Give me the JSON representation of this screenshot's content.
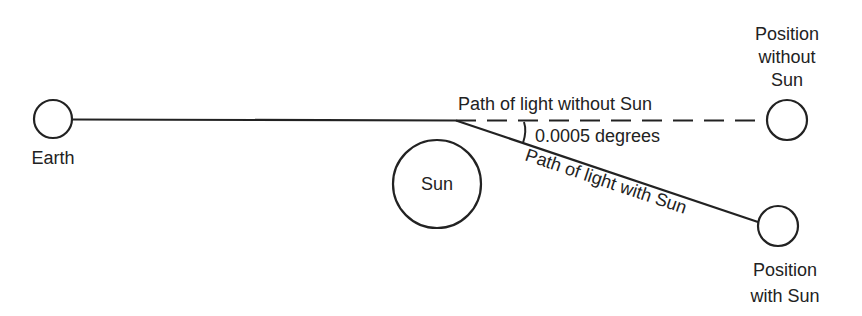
{
  "diagram": {
    "type": "gravitational-light-deflection",
    "colors": {
      "ink": "#222222",
      "background": "#ffffff"
    },
    "bodies": {
      "earth": {
        "label": "Earth"
      },
      "sun": {
        "label": "Sun"
      },
      "star_without_sun": {
        "label_lines": [
          "Position",
          "without",
          "Sun"
        ]
      },
      "star_with_sun": {
        "label_lines": [
          "Position",
          "with Sun"
        ]
      }
    },
    "paths": {
      "without_sun": {
        "label": "Path of light without Sun",
        "style": "dashed"
      },
      "with_sun": {
        "label": "Path of light with Sun",
        "style": "solid"
      }
    },
    "angle": {
      "label": "0.0005 degrees"
    }
  }
}
